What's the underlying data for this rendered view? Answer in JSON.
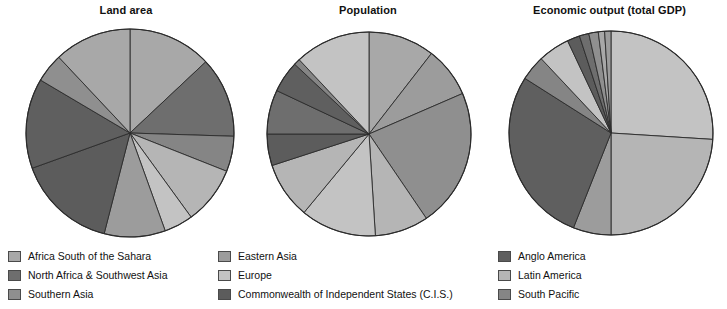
{
  "figure": {
    "background": "#ffffff",
    "slice_stroke": "#2b2b2b"
  },
  "palette": {
    "africa_south_of_sahara": "#a8a8a8",
    "north_africa_southwest_asia": "#6e6e6e",
    "southern_asia": "#8f8f8f",
    "eastern_asia": "#9c9c9c",
    "europe": "#c3c3c3",
    "cis": "#5c5c5c",
    "anglo_america": "#5f5f5f",
    "latin_america": "#b5b5b5",
    "south_pacific": "#858585"
  },
  "legend": {
    "columns": [
      {
        "items": [
          {
            "label": "Africa South of the Sahara",
            "color": "#a8a8a8",
            "key": "africa_south_of_sahara"
          },
          {
            "label": "North Africa & Southwest Asia",
            "color": "#6e6e6e",
            "key": "north_africa_southwest_asia"
          },
          {
            "label": "Southern Asia",
            "color": "#8f8f8f",
            "key": "southern_asia"
          }
        ]
      },
      {
        "items": [
          {
            "label": "Eastern Asia",
            "color": "#9c9c9c",
            "key": "eastern_asia"
          },
          {
            "label": "Europe",
            "color": "#c3c3c3",
            "key": "europe"
          },
          {
            "label": "Commonwealth of Independent States (C.I.S.)",
            "color": "#5c5c5c",
            "key": "cis"
          }
        ]
      },
      {
        "items": [
          {
            "label": "Anglo America",
            "color": "#5f5f5f",
            "key": "anglo_america"
          },
          {
            "label": "Latin America",
            "color": "#b5b5b5",
            "key": "latin_america"
          },
          {
            "label": "South Pacific",
            "color": "#858585",
            "key": "south_pacific"
          }
        ]
      }
    ]
  },
  "chart_data": [
    {
      "type": "pie",
      "title": "Land area",
      "xlabel": "",
      "ylabel": "",
      "units": "percent of world total",
      "start_angle_deg": 0,
      "direction": "clockwise",
      "categories": [
        "Africa South of the Sahara",
        "North Africa & Southwest Asia",
        "South Pacific",
        "Latin America",
        "Europe",
        "Eastern Asia",
        "Commonwealth of Independent States (C.I.S.)",
        "Anglo America",
        "Southern Asia"
      ],
      "values": [
        13.0,
        12.5,
        5.5,
        9.0,
        4.5,
        9.5,
        15.5,
        14.0,
        4.5
      ],
      "slices": [
        {
          "label": "Africa South of the Sahara",
          "value": 13.0,
          "color": "#a8a8a8"
        },
        {
          "label": "North Africa & Southwest Asia",
          "value": 12.5,
          "color": "#6e6e6e"
        },
        {
          "label": "South Pacific",
          "value": 5.5,
          "color": "#858585"
        },
        {
          "label": "Latin America",
          "value": 9.0,
          "color": "#b5b5b5"
        },
        {
          "label": "Europe",
          "value": 4.5,
          "color": "#c3c3c3"
        },
        {
          "label": "Eastern Asia",
          "value": 9.5,
          "color": "#9c9c9c"
        },
        {
          "label": "Commonwealth of Independent States (C.I.S.)",
          "value": 15.5,
          "color": "#5c5c5c"
        },
        {
          "label": "Anglo America",
          "value": 14.0,
          "color": "#5f5f5f"
        },
        {
          "label": "Southern Asia",
          "value": 4.5,
          "color": "#8f8f8f"
        },
        {
          "label": "Africa South of the Sahara",
          "value": 12.0,
          "color": "#a8a8a8"
        }
      ]
    },
    {
      "type": "pie",
      "title": "Population",
      "xlabel": "",
      "ylabel": "",
      "units": "percent of world total",
      "start_angle_deg": 0,
      "direction": "clockwise",
      "categories": [
        "Africa South of the Sahara",
        "Eastern Asia",
        "Southern Asia",
        "Latin America",
        "Europe",
        "Commonwealth of Independent States (C.I.S.)",
        "North Africa & Southwest Asia",
        "Anglo America",
        "South Pacific"
      ],
      "values": [
        10.5,
        8.0,
        22.0,
        8.5,
        12.0,
        5.0,
        7.0,
        5.0,
        1.0
      ],
      "slices": [
        {
          "label": "Africa South of the Sahara",
          "value": 10.5,
          "color": "#a8a8a8"
        },
        {
          "label": "Eastern Asia",
          "value": 8.0,
          "color": "#9c9c9c"
        },
        {
          "label": "Southern Asia",
          "value": 22.0,
          "color": "#8f8f8f"
        },
        {
          "label": "Latin America",
          "value": 8.5,
          "color": "#b5b5b5"
        },
        {
          "label": "Europe",
          "value": 12.0,
          "color": "#c3c3c3"
        },
        {
          "label": "Latin America",
          "value": 9.0,
          "color": "#b5b5b5"
        },
        {
          "label": "Commonwealth of Independent States (C.I.S.)",
          "value": 5.0,
          "color": "#5c5c5c"
        },
        {
          "label": "North Africa & Southwest Asia",
          "value": 7.0,
          "color": "#6e6e6e"
        },
        {
          "label": "Anglo America",
          "value": 5.0,
          "color": "#5f5f5f"
        },
        {
          "label": "South Pacific",
          "value": 1.0,
          "color": "#858585"
        },
        {
          "label": "Europe",
          "value": 12.0,
          "color": "#c3c3c3"
        }
      ]
    },
    {
      "type": "pie",
      "title": "Economic output (total GDP)",
      "xlabel": "",
      "ylabel": "",
      "units": "percent of world total",
      "start_angle_deg": 0,
      "direction": "clockwise",
      "categories": [
        "Europe",
        "Latin America",
        "Eastern Asia",
        "Anglo America",
        "Commonwealth of Independent States (C.I.S.)",
        "North Africa & Southwest Asia",
        "Southern Asia",
        "Africa South of the Sahara",
        "South Pacific"
      ],
      "values": [
        26.0,
        24.0,
        6.0,
        28.0,
        2.0,
        3.0,
        2.0,
        1.5,
        1.5
      ],
      "slices": [
        {
          "label": "Europe",
          "value": 26.0,
          "color": "#c3c3c3"
        },
        {
          "label": "Latin America",
          "value": 24.0,
          "color": "#b5b5b5"
        },
        {
          "label": "Eastern Asia",
          "value": 6.0,
          "color": "#9c9c9c"
        },
        {
          "label": "Anglo America",
          "value": 28.0,
          "color": "#5f5f5f"
        },
        {
          "label": "South Pacific",
          "value": 4.0,
          "color": "#858585"
        },
        {
          "label": "Europe",
          "value": 5.0,
          "color": "#c3c3c3"
        },
        {
          "label": "Commonwealth of Independent States (C.I.S.)",
          "value": 2.0,
          "color": "#5c5c5c"
        },
        {
          "label": "North Africa & Southwest Asia",
          "value": 1.5,
          "color": "#6e6e6e"
        },
        {
          "label": "Southern Asia",
          "value": 1.5,
          "color": "#8f8f8f"
        },
        {
          "label": "Africa South of the Sahara",
          "value": 1.0,
          "color": "#a8a8a8"
        },
        {
          "label": "Eastern Asia",
          "value": 1.0,
          "color": "#9c9c9c"
        }
      ]
    }
  ],
  "charts_layout": [
    {
      "left": 6,
      "width": 240,
      "cx": 124,
      "cy": 133,
      "r": 104
    },
    {
      "left": 252,
      "width": 232,
      "cx": 117,
      "cy": 134,
      "r": 102
    },
    {
      "left": 492,
      "width": 235,
      "cx": 119,
      "cy": 133,
      "r": 102
    }
  ],
  "legend_layout": [
    {
      "left": 8
    },
    {
      "left": 218
    },
    {
      "left": 498
    }
  ]
}
